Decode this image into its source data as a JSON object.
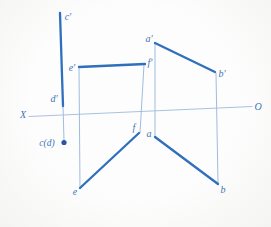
{
  "diagram": {
    "canvas": {
      "width": 271,
      "height": 227
    },
    "colors": {
      "thick_line": "#2f6fbc",
      "thin_line": "#9fbcdf",
      "axis_line": "#a9c2e0",
      "label_text": "#3f74b8",
      "point_dot": "#28569f",
      "background": "#fbfbfa"
    },
    "axis": {
      "name": "x-o-axis",
      "x1": 29,
      "y1": 116.5,
      "x2": 252,
      "y2": 106.5,
      "label_left": "X",
      "label_right": "O"
    },
    "segments": [
      {
        "name": "segment-c-prime-d-prime",
        "kind": "thick",
        "x1": 60,
        "y1": 13,
        "x2": 63,
        "y2": 106
      },
      {
        "name": "segment-e-prime-f-prime",
        "kind": "thick",
        "x1": 79,
        "y1": 67,
        "x2": 145,
        "y2": 64
      },
      {
        "name": "segment-a-prime-b-prime",
        "kind": "thick",
        "x1": 155,
        "y1": 43,
        "x2": 215,
        "y2": 72
      },
      {
        "name": "segment-e-f",
        "kind": "thick",
        "x1": 80,
        "y1": 188,
        "x2": 139,
        "y2": 133
      },
      {
        "name": "segment-a-b",
        "kind": "thick",
        "x1": 155,
        "y1": 137,
        "x2": 218,
        "y2": 184
      },
      {
        "name": "projector-d-prime-to-c-d",
        "kind": "thin",
        "x1": 63,
        "y1": 106,
        "x2": 64,
        "y2": 140
      },
      {
        "name": "projector-e-prime-to-e",
        "kind": "thin",
        "x1": 79,
        "y1": 67,
        "x2": 80,
        "y2": 188
      },
      {
        "name": "projector-f-prime-to-f",
        "kind": "thin",
        "x1": 144,
        "y1": 65,
        "x2": 140,
        "y2": 133
      },
      {
        "name": "projector-a-prime-to-a",
        "kind": "thin",
        "x1": 155,
        "y1": 43,
        "x2": 155,
        "y2": 136
      },
      {
        "name": "projector-b-prime-to-b",
        "kind": "thin",
        "x1": 216,
        "y1": 73,
        "x2": 218,
        "y2": 183
      }
    ],
    "labels": [
      {
        "name": "label-axis-x",
        "text": "X",
        "x": 23,
        "y": 114,
        "small": false
      },
      {
        "name": "label-axis-o",
        "text": "O",
        "x": 258,
        "y": 106,
        "small": false
      },
      {
        "name": "label-c-prime",
        "text": "c′",
        "x": 68,
        "y": 16,
        "small": false
      },
      {
        "name": "label-d-prime",
        "text": "d′",
        "x": 54,
        "y": 98,
        "small": false
      },
      {
        "name": "label-c-d",
        "text": "c(d)",
        "x": 47,
        "y": 142,
        "small": true
      },
      {
        "name": "label-e-prime",
        "text": "e′",
        "x": 72,
        "y": 67,
        "small": false
      },
      {
        "name": "label-f-prime",
        "text": "f′",
        "x": 150,
        "y": 62,
        "small": false
      },
      {
        "name": "label-a-prime",
        "text": "a′",
        "x": 149,
        "y": 38,
        "small": false
      },
      {
        "name": "label-b-prime",
        "text": "b′",
        "x": 222,
        "y": 73,
        "small": false
      },
      {
        "name": "label-e",
        "text": "e",
        "x": 75,
        "y": 191,
        "small": false
      },
      {
        "name": "label-f",
        "text": "f",
        "x": 134,
        "y": 127,
        "small": false
      },
      {
        "name": "label-a",
        "text": "a",
        "x": 149,
        "y": 133,
        "small": false
      },
      {
        "name": "label-b",
        "text": "b",
        "x": 223,
        "y": 189,
        "small": false
      }
    ],
    "point": {
      "name": "point-c-d-dot",
      "cx": 64,
      "cy": 142.5,
      "r": 2.6
    }
  }
}
